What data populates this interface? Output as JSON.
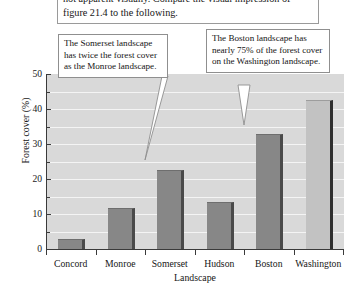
{
  "caption": {
    "text": "not apparent visually. Compare the visual impression of figure 21.4 to the following."
  },
  "annotations": [
    {
      "id": "somerset",
      "text": "The Somerset landscape has twice the forest cover as the Monroe landscape.",
      "target": "Somerset"
    },
    {
      "id": "boston",
      "text": "The Boston landscape has nearly 75% of the forest cover on the Washington landscape.",
      "target": "Boston"
    }
  ],
  "chart_data": {
    "type": "bar",
    "title": "",
    "xlabel": "Landscape",
    "ylabel": "Forest cover (%)",
    "categories": [
      "Concord",
      "Monroe",
      "Somerset",
      "Hudson",
      "Boston",
      "Washington"
    ],
    "values": [
      3,
      11.8,
      22.5,
      13.5,
      33,
      42.5
    ],
    "ylim": [
      0,
      50
    ],
    "yticks": [
      0,
      10,
      20,
      30,
      40,
      50
    ],
    "ytick_labels": [
      "0",
      "10",
      "20",
      "30",
      "40",
      "50"
    ],
    "yminorticks": [
      5,
      15,
      25,
      35,
      45
    ],
    "gridlines": [
      5,
      10,
      15,
      20,
      25,
      30,
      35,
      40,
      45
    ],
    "grid": true,
    "legend": "none",
    "bar_colors": [
      "#878787",
      "#878787",
      "#878787",
      "#878787",
      "#878787",
      "#c2c2c2"
    ],
    "plot_background": "#d9d9d9",
    "gridline_color": "#f4f4f4",
    "axis_color": "#3a3a3a"
  }
}
